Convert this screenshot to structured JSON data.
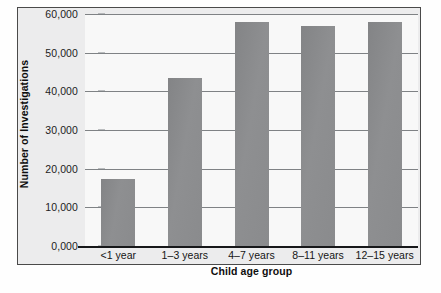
{
  "chart_data": {
    "type": "bar",
    "title": "",
    "subtitle": "",
    "xlabel": "Child age group",
    "ylabel": "Number of Investigations",
    "categories": [
      "<1 year",
      "1–3 years",
      "4–7 years",
      "8–11 years",
      "12–15 years"
    ],
    "values": [
      17300,
      43500,
      58000,
      57000,
      58000
    ],
    "series": [
      {
        "name": "Number of Investigations",
        "values": [
          17300,
          43500,
          58000,
          57000,
          58000
        ]
      }
    ],
    "ylim": [
      0,
      60000
    ],
    "ytick_values": [
      0,
      10000,
      20000,
      30000,
      40000,
      50000,
      60000
    ],
    "ytick_labels": [
      "0,000",
      "10,000",
      "20,000",
      "30,000",
      "40,000",
      "50,000",
      "60,000"
    ],
    "grid": true,
    "grid_axis": "y",
    "legend": false,
    "legend_position": "none",
    "bar_color": "#8b8c8e",
    "gridline_color": "#7f8285",
    "axis_color": "#17181a",
    "plot_background": "#f8f8f8",
    "figure_background": "#ececed"
  }
}
